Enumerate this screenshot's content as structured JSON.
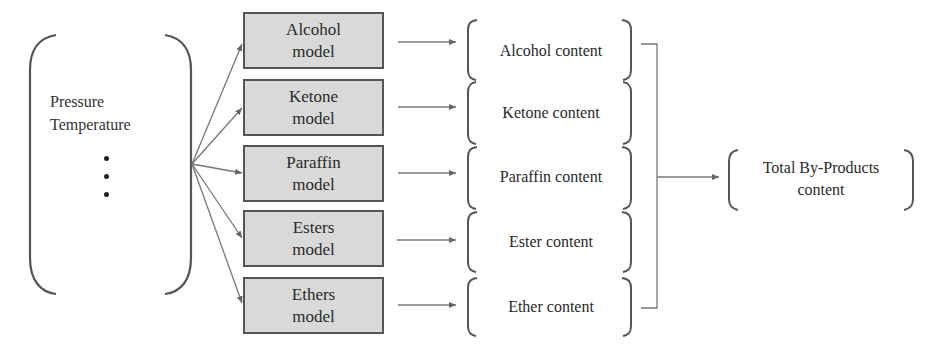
{
  "inputs": {
    "items": [
      "Pressure",
      "Temperature"
    ],
    "ellipsis": "vertical-dots"
  },
  "models": [
    {
      "line1": "Alcohol",
      "line2": "model"
    },
    {
      "line1": "Ketone",
      "line2": "model"
    },
    {
      "line1": "Paraffin",
      "line2": "model"
    },
    {
      "line1": "Esters",
      "line2": "model"
    },
    {
      "line1": "Ethers",
      "line2": "model"
    }
  ],
  "contents": [
    {
      "label": "Alcohol content"
    },
    {
      "label": "Ketone content"
    },
    {
      "label": "Paraffin content"
    },
    {
      "label": "Ester content"
    },
    {
      "label": "Ether content"
    }
  ],
  "output": {
    "line1": "Total By-Products",
    "line2": "content"
  },
  "colors": {
    "box_fill": "#d9d9d9",
    "box_border": "#555555",
    "line": "#777777",
    "text": "#2a2a2a"
  }
}
